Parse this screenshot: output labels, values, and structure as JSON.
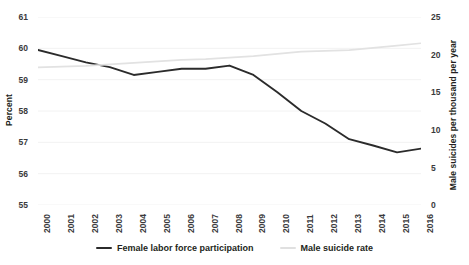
{
  "chart_data": {
    "type": "line",
    "title": "",
    "xlabel": "",
    "ylabel": "Percent",
    "y2label": "Male suicides per thousand per year",
    "x": [
      2000,
      2001,
      2002,
      2003,
      2004,
      2005,
      2006,
      2007,
      2008,
      2009,
      2010,
      2011,
      2012,
      2013,
      2014,
      2015,
      2016
    ],
    "xticklabels": [
      "2000",
      "2001",
      "2002",
      "2003",
      "2004",
      "2005",
      "2006",
      "2007",
      "2008",
      "2009",
      "2010",
      "2011",
      "2012",
      "2013",
      "2014",
      "2015",
      "2016"
    ],
    "yticklabels": [
      "61",
      "60",
      "59",
      "58",
      "57",
      "56",
      "55"
    ],
    "y2ticklabels": [
      "25",
      "20",
      "15",
      "10",
      "5",
      "0"
    ],
    "ylim": [
      55,
      61
    ],
    "y2lim": [
      0,
      25
    ],
    "grid": true,
    "legend_position": "bottom",
    "series": [
      {
        "name": "Female labor force participation",
        "axis": "left",
        "color": "#2b2b2b",
        "values": [
          59.95,
          59.75,
          59.55,
          59.4,
          59.15,
          59.25,
          59.35,
          59.35,
          59.45,
          59.15,
          58.6,
          58.0,
          57.6,
          57.1,
          56.9,
          56.68,
          56.8
        ]
      },
      {
        "name": "Male suicide rate",
        "axis": "right",
        "color": "#e2e2e2",
        "values": [
          18.3,
          18.4,
          18.5,
          18.7,
          18.9,
          19.1,
          19.3,
          19.4,
          19.6,
          19.8,
          20.1,
          20.4,
          20.5,
          20.6,
          20.9,
          21.2,
          21.5
        ]
      }
    ]
  },
  "legend": {
    "items": [
      {
        "label": "Female labor force participation",
        "color": "#2b2b2b"
      },
      {
        "label": "Male suicide rate",
        "color": "#e0e0e0"
      }
    ]
  }
}
